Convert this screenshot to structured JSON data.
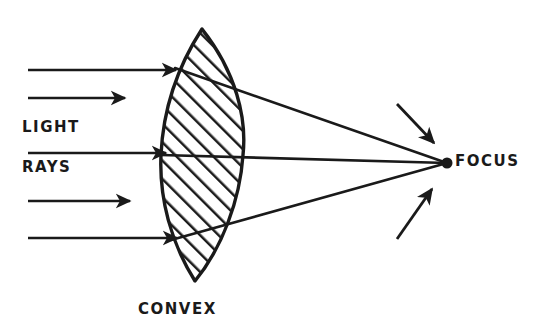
{
  "figure": {
    "background_color": "#ffffff",
    "ink_color": "#1a1a1a",
    "width": 554,
    "height": 336
  },
  "labels": {
    "light": "LIGHT",
    "rays": "RAYS",
    "convex": "CONVEX",
    "focus": "FOCUS"
  },
  "lens": {
    "name": "convex-lens",
    "shape": "biconvex",
    "fill": "diagonal-hatching",
    "top_tip_x": 202,
    "top_tip_y": 29,
    "bottom_tip_x": 195,
    "bottom_tip_y": 281,
    "left_edge_x": 161,
    "right_edge_x": 243,
    "axis_y": 155
  },
  "focus_point": {
    "name": "focus-point",
    "x": 447,
    "y": 163,
    "radius": 5
  },
  "incoming_rays": [
    {
      "name": "incoming-ray-1",
      "y": 70,
      "x_start": 28,
      "x_end": 176
    },
    {
      "name": "incoming-ray-2",
      "y": 98,
      "x_start": 28,
      "x_end": 125
    },
    {
      "name": "incoming-ray-3",
      "y": 153,
      "x_start": 28,
      "x_end": 166
    },
    {
      "name": "incoming-ray-4",
      "y": 201,
      "x_start": 28,
      "x_end": 130
    },
    {
      "name": "incoming-ray-5",
      "y": 238,
      "x_start": 28,
      "x_end": 177
    }
  ],
  "refracted_rays": [
    {
      "name": "refracted-ray-upper",
      "x1": 200,
      "y1": 80,
      "x2": 447,
      "y2": 163
    },
    {
      "name": "refracted-ray-middle",
      "x1": 161,
      "y1": 155,
      "x2": 447,
      "y2": 163
    },
    {
      "name": "refracted-ray-lower",
      "x1": 196,
      "y1": 233,
      "x2": 447,
      "y2": 163
    }
  ],
  "pointer_arrows": [
    {
      "name": "focus-pointer-upper",
      "x1": 397,
      "y1": 104,
      "x2": 434,
      "y2": 143
    },
    {
      "name": "focus-pointer-lower",
      "x1": 397,
      "y1": 239,
      "x2": 432,
      "y2": 189
    }
  ]
}
